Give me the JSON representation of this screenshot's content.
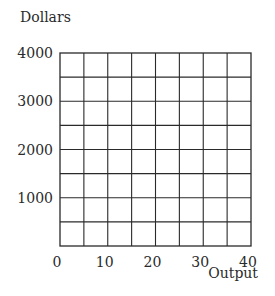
{
  "chart_data": {
    "type": "line",
    "title": "",
    "ylabel": "Dollars",
    "xlabel": "Output",
    "xlim": [
      0,
      40
    ],
    "ylim": [
      0,
      4000
    ],
    "x_ticks": [
      0,
      10,
      20,
      30,
      40
    ],
    "y_ticks": [
      1000,
      2000,
      3000,
      4000
    ],
    "x_tick_labels": [
      "0",
      "10",
      "20",
      "30",
      "40"
    ],
    "y_tick_labels": [
      "1000",
      "2000",
      "3000",
      "4000"
    ],
    "x_grid_step": 5,
    "y_grid_step": 500,
    "grid": true,
    "series": []
  }
}
